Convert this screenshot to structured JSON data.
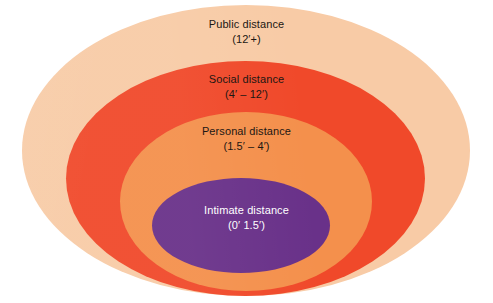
{
  "figure": {
    "background_color": "#ffffff",
    "shape": "nested-ellipses"
  },
  "chart_data": {
    "type": "pie",
    "title": "",
    "subtitle": "",
    "xlabel": "",
    "ylabel": "",
    "legend_position": "inline-labels",
    "grid": false,
    "categories": [
      "Public distance",
      "Social distance",
      "Personal distance",
      "Intimate distance"
    ],
    "values": [
      12,
      12,
      4,
      1.5
    ],
    "series": [
      {
        "name": "Proxemic zone outer boundary (feet)",
        "values": [
          12,
          12,
          4,
          1.5
        ]
      }
    ],
    "annotations": [
      "Public distance (12′+)",
      "Social distance (4′ – 12′)",
      "Personal distance (1.5′ – 4′)",
      "Intimate distance (0′   1.5′)"
    ]
  },
  "zones": [
    {
      "id": "public",
      "title": "Public distance",
      "range": "(12′+)",
      "fill": "#f8cba6",
      "text_color": "#1c1713"
    },
    {
      "id": "social",
      "title": "Social distance",
      "range": "(4′ – 12′)",
      "fill": "#f0492a",
      "text_color": "#1c1713"
    },
    {
      "id": "personal",
      "title": "Personal distance",
      "range": "(1.5′ – 4′)",
      "fill": "#f4904c",
      "text_color": "#1c1713"
    },
    {
      "id": "intimate",
      "title": "Intimate distance",
      "range": "(0′   1.5′)",
      "fill": "#693189",
      "text_color": "#ffffff"
    }
  ]
}
